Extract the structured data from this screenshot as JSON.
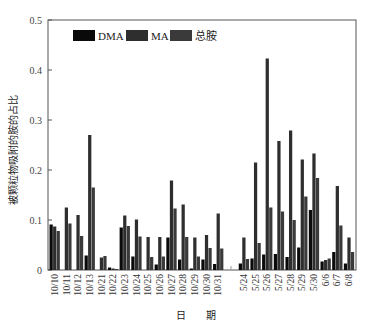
{
  "chart_data": {
    "type": "bar",
    "title": "",
    "xlabel": "日 期",
    "ylabel": "被颗粒物吸附的胺的占比",
    "ylim": [
      0,
      0.5
    ],
    "yticks": [
      0,
      0.1,
      0.2,
      0.3,
      0.4,
      0.5
    ],
    "ytick_labels": [
      "0",
      "0.1",
      "0.2",
      "0.3",
      "0.4",
      "0.5"
    ],
    "grid": false,
    "legend_position": "top-left inside",
    "categories": [
      "10/10",
      "10/11",
      "10/12",
      "10/13",
      "10/21",
      "10/22",
      "10/23",
      "10/24",
      "10/25",
      "10/26",
      "10/27",
      "10/28",
      "10/29",
      "10/30",
      "10/31",
      "5/24",
      "5/25",
      "5/26",
      "5/27",
      "5/28",
      "5/29",
      "5/30",
      "6/6",
      "6/7",
      "6/8"
    ],
    "series": [
      {
        "name": "DMA",
        "color": "#0a0a0a",
        "values": [
          0.091,
          0.0,
          0.0,
          0.029,
          0.0,
          0.005,
          0.085,
          0.027,
          0.0,
          0.011,
          0.065,
          0.021,
          0.003,
          0.021,
          0.012,
          0.013,
          0.023,
          0.031,
          0.032,
          0.026,
          0.045,
          0.12,
          0.017,
          0.036,
          0.013
        ]
      },
      {
        "name": "MA",
        "color": "#2e2e2e",
        "values": [
          0.087,
          0.125,
          0.11,
          0.27,
          0.025,
          0.003,
          0.109,
          0.101,
          0.066,
          0.066,
          0.179,
          0.131,
          0.065,
          0.07,
          0.113,
          0.065,
          0.215,
          0.423,
          0.258,
          0.279,
          0.221,
          0.233,
          0.02,
          0.168,
          0.065
        ]
      },
      {
        "name": "总胺",
        "color": "#3a3a3a",
        "values": [
          0.078,
          0.093,
          0.068,
          0.165,
          0.028,
          0.002,
          0.088,
          0.067,
          0.026,
          0.027,
          0.123,
          0.066,
          0.027,
          0.044,
          0.043,
          0.022,
          0.054,
          0.125,
          0.117,
          0.1,
          0.147,
          0.184,
          0.023,
          0.089,
          0.036
        ]
      }
    ],
    "gap_after_category": "10/31"
  }
}
